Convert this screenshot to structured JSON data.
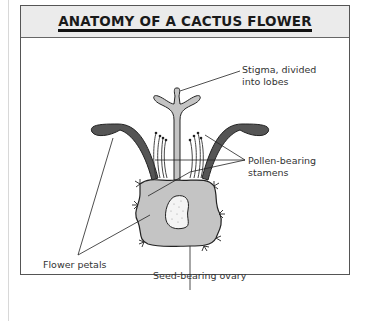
{
  "header": {
    "title": "ANATOMY OF A CACTUS FLOWER"
  },
  "labels": {
    "stigma_line1": "Stigma, divided",
    "stigma_line2": "into lobes",
    "stamens_line1": "Pollen-bearing",
    "stamens_line2": "stamens",
    "petals": "Flower petals",
    "ovary": "Seed-bearing ovary"
  },
  "colors": {
    "header_bg": "#ebebeb",
    "petal": "#555555",
    "body_fill": "#c4c4c4",
    "ovary_fill": "#f4f4f4",
    "outline": "#222222"
  }
}
